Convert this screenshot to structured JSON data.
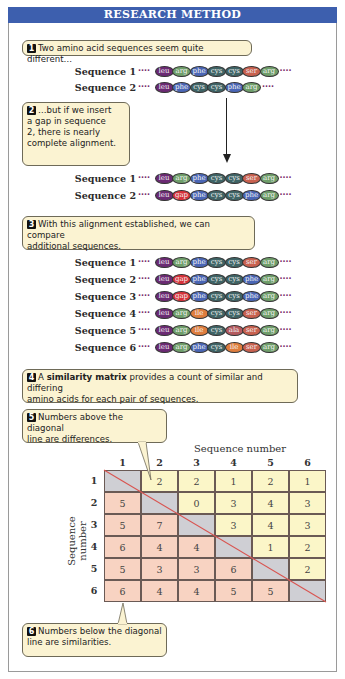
{
  "header": {
    "title": "RESEARCH METHOD",
    "color": "#3d5fae"
  },
  "steps": [
    {
      "n": "1",
      "text": "Two amino acid sequences seem quite different…"
    },
    {
      "n": "2",
      "lines": [
        "…but if we insert",
        "a gap in sequence",
        "2, there is nearly",
        "complete alignment."
      ]
    },
    {
      "n": "3",
      "lines": [
        "With this alignment established, we can compare",
        "additional sequences."
      ]
    },
    {
      "n": "4",
      "pre": "A ",
      "bold": "similarity matrix",
      "post": " provides a count of similar and differing",
      "line2": "amino acids for each pair of sequences."
    },
    {
      "n": "5",
      "lines": [
        "Numbers above the diagonal",
        "line are differences."
      ]
    },
    {
      "n": "6",
      "lines": [
        "Numbers below the diagonal",
        "line are similarities."
      ]
    }
  ],
  "amino_colors": {
    "leu": "#6b2a73",
    "arg": "#6f9e6a",
    "phe": "#4a66b5",
    "cys": "#3f6466",
    "ser": "#c8614f",
    "gap": "#d8323a",
    "ile": "#de7d3e",
    "ala": "#b45a5f"
  },
  "alignment_1": [
    {
      "label": "Sequence 1",
      "residues": [
        "leu",
        "arg",
        "phe",
        "cys",
        "cys",
        "ser",
        "arg"
      ]
    },
    {
      "label": "Sequence 2",
      "residues": [
        "leu",
        "phe",
        "cys",
        "cys",
        "phe",
        "arg"
      ]
    }
  ],
  "alignment_2": [
    {
      "label": "Sequence 1",
      "residues": [
        "leu",
        "arg",
        "phe",
        "cys",
        "cys",
        "ser",
        "arg"
      ]
    },
    {
      "label": "Sequence 2",
      "residues": [
        "leu",
        "gap",
        "phe",
        "cys",
        "cys",
        "phe",
        "arg"
      ]
    }
  ],
  "alignment_3": [
    {
      "label": "Sequence 1",
      "residues": [
        "leu",
        "arg",
        "phe",
        "cys",
        "cys",
        "ser",
        "arg"
      ]
    },
    {
      "label": "Sequence 2",
      "residues": [
        "leu",
        "gap",
        "phe",
        "cys",
        "cys",
        "phe",
        "arg"
      ]
    },
    {
      "label": "Sequence 3",
      "residues": [
        "leu",
        "gap",
        "phe",
        "cys",
        "cys",
        "phe",
        "arg"
      ]
    },
    {
      "label": "Sequence 4",
      "residues": [
        "leu",
        "arg",
        "ile",
        "cys",
        "cys",
        "ser",
        "arg"
      ]
    },
    {
      "label": "Sequence 5",
      "residues": [
        "leu",
        "arg",
        "ile",
        "cys",
        "ala",
        "ser",
        "arg"
      ]
    },
    {
      "label": "Sequence 6",
      "residues": [
        "leu",
        "arg",
        "phe",
        "cys",
        "ile",
        "ser",
        "arg"
      ]
    }
  ],
  "dots": "····",
  "matrix": {
    "x_axis_label": "Sequence number",
    "y_axis_label": "Sequence number",
    "col_labels": [
      "1",
      "2",
      "3",
      "4",
      "5",
      "6"
    ],
    "row_labels": [
      "1",
      "2",
      "3",
      "4",
      "5",
      "6"
    ],
    "values": [
      [
        "",
        "2",
        "2",
        "1",
        "2",
        "1"
      ],
      [
        "5",
        "",
        "0",
        "3",
        "4",
        "3"
      ],
      [
        "5",
        "7",
        "",
        "3",
        "4",
        "3"
      ],
      [
        "6",
        "4",
        "4",
        "",
        "1",
        "2"
      ],
      [
        "5",
        "3",
        "3",
        "6",
        "",
        "2"
      ],
      [
        "6",
        "4",
        "4",
        "5",
        "5",
        ""
      ]
    ],
    "colors": {
      "upper": "#fbf6c8",
      "lower": "#f8d3c2",
      "diagonal": "#cfcfd4",
      "diagonal_line": "#d9534f"
    }
  }
}
